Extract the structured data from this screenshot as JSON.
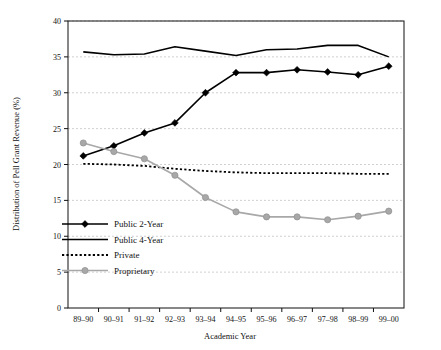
{
  "chart_data": {
    "type": "line",
    "title": "",
    "xlabel": "Academic Year",
    "ylabel": "Distribution of Pell Grant Revenue (%)",
    "categories": [
      "89–90",
      "90–91",
      "91–92",
      "92–93",
      "93–94",
      "94–95",
      "95–96",
      "96–97",
      "97–98",
      "98–99",
      "99–00"
    ],
    "ylim": [
      0,
      40
    ],
    "yticks": [
      0,
      5,
      10,
      15,
      20,
      25,
      30,
      35,
      40
    ],
    "ytick_labels": [
      "0",
      "5",
      "10",
      "15",
      "20",
      "25",
      "30",
      "35",
      "40"
    ],
    "grid": "horizontal-dashed",
    "legend_position": "inside-lower-left",
    "series": [
      {
        "name": "Public 2-Year",
        "marker": "diamond",
        "style": "solid",
        "color": "#000000",
        "values": [
          21.2,
          22.6,
          24.4,
          25.8,
          30.0,
          32.8,
          32.8,
          33.2,
          32.9,
          32.5,
          33.7
        ]
      },
      {
        "name": "Public 4-Year",
        "marker": "none",
        "style": "solid",
        "color": "#000000",
        "values": [
          35.7,
          35.3,
          35.4,
          36.4,
          35.8,
          35.2,
          36.0,
          36.1,
          36.6,
          36.6,
          35.0
        ]
      },
      {
        "name": "Private",
        "marker": "none",
        "style": "dotted",
        "color": "#000000",
        "values": [
          20.1,
          20.0,
          19.8,
          19.4,
          19.1,
          18.9,
          18.8,
          18.8,
          18.8,
          18.7,
          18.7
        ]
      },
      {
        "name": "Proprietary",
        "marker": "circle",
        "style": "solid",
        "color": "#a8a8a8",
        "values": [
          23.0,
          21.8,
          20.8,
          18.5,
          15.4,
          13.4,
          12.7,
          12.7,
          12.3,
          12.8,
          13.5
        ]
      }
    ]
  },
  "legend": {
    "items": [
      {
        "label": "Public 2-Year"
      },
      {
        "label": "Public 4-Year"
      },
      {
        "label": "Private"
      },
      {
        "label": "Proprietary"
      }
    ]
  }
}
